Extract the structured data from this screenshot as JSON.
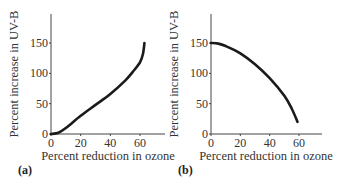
{
  "chart_data": [
    {
      "type": "line",
      "panel_label": "(a)",
      "xlabel": "Percent reduction in ozone",
      "ylabel": "Percent increase in UV-B",
      "xlim": [
        0,
        75
      ],
      "ylim": [
        0,
        190
      ],
      "xticks": [
        0,
        20,
        40,
        60
      ],
      "yticks": [
        0,
        50,
        100,
        150
      ],
      "grid": false,
      "series": [
        {
          "name": "curve-a",
          "x": [
            0,
            5,
            10,
            20,
            30,
            40,
            50,
            55,
            60,
            62,
            63
          ],
          "y": [
            0,
            2,
            10,
            30,
            48,
            66,
            88,
            102,
            118,
            132,
            150
          ]
        }
      ]
    },
    {
      "type": "line",
      "panel_label": "(b)",
      "xlabel": "Percent reduction in ozone",
      "ylabel": "Percent increase in UV-B",
      "xlim": [
        0,
        75
      ],
      "ylim": [
        0,
        190
      ],
      "xticks": [
        0,
        20,
        40,
        60
      ],
      "yticks": [
        0,
        50,
        100,
        150
      ],
      "grid": false,
      "series": [
        {
          "name": "curve-b",
          "x": [
            0,
            5,
            10,
            20,
            30,
            40,
            50,
            55,
            59
          ],
          "y": [
            150,
            149,
            145,
            133,
            115,
            92,
            63,
            42,
            20
          ]
        }
      ]
    }
  ]
}
